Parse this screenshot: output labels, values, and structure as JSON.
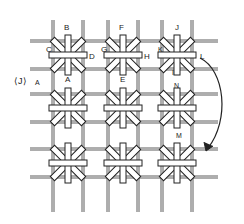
{
  "diagram": {
    "title": "",
    "type": "needlework-stitch-diagram",
    "grid": {
      "columns": 3,
      "rows": 3
    },
    "stitch": "double cross star stitch",
    "colors": {
      "ink": "#222222",
      "background": "#ffffff"
    },
    "labels": {
      "B": "B",
      "C": "C",
      "D": "D",
      "A": "A",
      "F": "F",
      "G": "G",
      "H": "H",
      "E": "E",
      "J": "J",
      "K": "K",
      "L": "L",
      "I": "I",
      "N": "N",
      "M": "M",
      "left_marker": "⟨J⟩",
      "left_marker_letter": "A"
    },
    "arrow": {
      "direction": "curved-down",
      "icon": "curved-arrow-icon"
    }
  }
}
